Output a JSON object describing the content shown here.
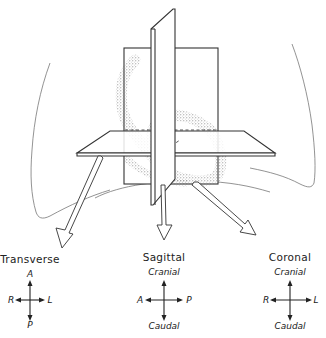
{
  "figure": {
    "colors": {
      "line": "#333333",
      "stipple": "#999999",
      "background": "#ffffff"
    }
  },
  "planes": [
    {
      "name": "Transverse",
      "axes": {
        "top": "A",
        "bottom": "P",
        "left": "R",
        "right": "L"
      }
    },
    {
      "name": "Sagittal",
      "axes": {
        "top": "Cranial",
        "bottom": "Caudal",
        "left": "A",
        "right": "P"
      }
    },
    {
      "name": "Coronal",
      "axes": {
        "top": "Cranial",
        "bottom": "Caudal",
        "left": "R",
        "right": "L"
      }
    }
  ]
}
